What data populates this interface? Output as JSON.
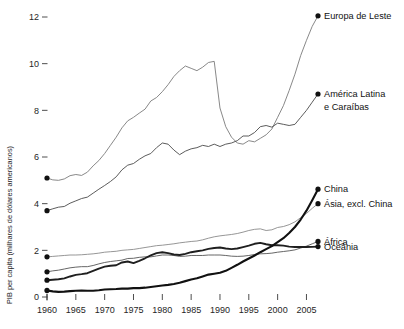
{
  "chart_data": {
    "type": "line",
    "title": "",
    "subtitle": "",
    "xlabel": "",
    "ylabel": "PIB per capita (milhares de dólares americanos)",
    "xlim": [
      1960,
      2007
    ],
    "ylim": [
      0,
      12.6
    ],
    "grid": false,
    "legend_position": "right-inline-labels",
    "x_ticks": [
      "1960",
      "1965",
      "1970",
      "1975",
      "1980",
      "1985",
      "1990",
      "1995",
      "2000",
      "2005"
    ],
    "x_tick_values": [
      1960,
      1965,
      1970,
      1975,
      1980,
      1985,
      1990,
      1995,
      2000,
      2005
    ],
    "y_ticks": [
      "0",
      "2",
      "4",
      "6",
      "8",
      "10",
      "12"
    ],
    "y_tick_values": [
      0,
      2,
      4,
      6,
      8,
      10,
      12
    ],
    "x": [
      1960,
      1961,
      1962,
      1963,
      1964,
      1965,
      1966,
      1967,
      1968,
      1969,
      1970,
      1971,
      1972,
      1973,
      1974,
      1975,
      1976,
      1977,
      1978,
      1979,
      1980,
      1981,
      1982,
      1983,
      1984,
      1985,
      1986,
      1987,
      1988,
      1989,
      1990,
      1991,
      1992,
      1993,
      1994,
      1995,
      1996,
      1997,
      1998,
      1999,
      2000,
      2001,
      2002,
      2003,
      2004,
      2005,
      2006,
      2007
    ],
    "series": [
      {
        "name": "Europa de Leste",
        "color": "#7a7a7a",
        "width": 0.9,
        "label_x": 2008,
        "values": [
          5.1,
          5.02,
          5.0,
          5.06,
          5.2,
          5.25,
          5.21,
          5.35,
          5.62,
          5.85,
          6.15,
          6.5,
          6.85,
          7.25,
          7.55,
          7.7,
          7.88,
          8.05,
          8.4,
          8.55,
          8.8,
          9.1,
          9.45,
          9.7,
          9.9,
          9.8,
          9.7,
          9.85,
          10.05,
          10.1,
          8.1,
          7.3,
          6.85,
          6.6,
          6.55,
          6.7,
          6.65,
          6.8,
          6.95,
          7.2,
          7.7,
          8.2,
          8.85,
          9.55,
          10.35,
          11.0,
          11.6,
          12.05
        ]
      },
      {
        "name": "América Latina e Caraíbas",
        "color": "#4a4a4a",
        "width": 0.9,
        "label_x": 2008,
        "values": [
          3.7,
          3.78,
          3.85,
          3.88,
          4.02,
          4.12,
          4.22,
          4.28,
          4.45,
          4.62,
          4.78,
          4.95,
          5.15,
          5.45,
          5.65,
          5.72,
          5.9,
          6.05,
          6.15,
          6.4,
          6.6,
          6.55,
          6.3,
          6.1,
          6.25,
          6.35,
          6.4,
          6.5,
          6.45,
          6.55,
          6.45,
          6.55,
          6.6,
          6.7,
          6.9,
          6.9,
          7.05,
          7.3,
          7.35,
          7.28,
          7.45,
          7.4,
          7.35,
          7.4,
          7.7,
          8.0,
          8.35,
          8.7
        ]
      },
      {
        "name": "Ásia, excl. China",
        "color": "#8a8a8a",
        "width": 0.9,
        "label_x": 2008,
        "values": [
          1.72,
          1.74,
          1.76,
          1.78,
          1.8,
          1.8,
          1.81,
          1.83,
          1.85,
          1.88,
          1.92,
          1.94,
          1.96,
          2.0,
          2.02,
          2.04,
          2.08,
          2.12,
          2.16,
          2.2,
          2.22,
          2.25,
          2.28,
          2.32,
          2.35,
          2.38,
          2.4,
          2.45,
          2.52,
          2.58,
          2.62,
          2.65,
          2.68,
          2.72,
          2.78,
          2.85,
          2.9,
          2.92,
          2.85,
          2.88,
          2.98,
          3.02,
          3.1,
          3.22,
          3.4,
          3.58,
          3.8,
          4.0
        ]
      },
      {
        "name": "África",
        "color": "#555555",
        "width": 0.9,
        "label_x": 2008,
        "values": [
          1.08,
          1.12,
          1.15,
          1.2,
          1.25,
          1.28,
          1.3,
          1.3,
          1.35,
          1.42,
          1.48,
          1.52,
          1.55,
          1.58,
          1.65,
          1.66,
          1.7,
          1.72,
          1.72,
          1.76,
          1.8,
          1.8,
          1.78,
          1.74,
          1.75,
          1.78,
          1.78,
          1.78,
          1.8,
          1.8,
          1.8,
          1.78,
          1.75,
          1.74,
          1.75,
          1.78,
          1.82,
          1.85,
          1.86,
          1.88,
          1.92,
          1.95,
          1.98,
          2.02,
          2.1,
          2.18,
          2.28,
          2.38
        ]
      },
      {
        "name": "Oceânia",
        "color": "#1f1f1f",
        "width": 1.9,
        "label_x": 2008,
        "values": [
          0.72,
          0.74,
          0.76,
          0.8,
          0.88,
          0.95,
          0.98,
          1.02,
          1.12,
          1.22,
          1.3,
          1.34,
          1.36,
          1.48,
          1.52,
          1.45,
          1.55,
          1.66,
          1.78,
          1.88,
          1.92,
          1.88,
          1.82,
          1.8,
          1.85,
          1.92,
          1.96,
          2.0,
          2.06,
          2.1,
          2.12,
          2.08,
          2.05,
          2.08,
          2.14,
          2.2,
          2.28,
          2.32,
          2.26,
          2.22,
          2.22,
          2.2,
          2.16,
          2.14,
          2.14,
          2.14,
          2.15,
          2.16
        ]
      },
      {
        "name": "China",
        "color": "#111111",
        "width": 2.1,
        "label_x": 2008,
        "values": [
          0.28,
          0.24,
          0.22,
          0.23,
          0.25,
          0.27,
          0.28,
          0.27,
          0.27,
          0.29,
          0.32,
          0.33,
          0.34,
          0.36,
          0.36,
          0.38,
          0.38,
          0.4,
          0.43,
          0.46,
          0.49,
          0.52,
          0.56,
          0.61,
          0.68,
          0.75,
          0.8,
          0.88,
          0.96,
          1.0,
          1.04,
          1.12,
          1.25,
          1.38,
          1.52,
          1.65,
          1.78,
          1.92,
          2.05,
          2.18,
          2.35,
          2.52,
          2.74,
          3.0,
          3.32,
          3.7,
          4.15,
          4.62
        ]
      }
    ],
    "annotations": [
      {
        "text": "Europa de Leste",
        "value": 12.05,
        "year": 2007
      },
      {
        "text": "América Latina",
        "value": 8.7,
        "year": 2007
      },
      {
        "text": "e Caraíbas",
        "value": 8.7,
        "year": 2007
      },
      {
        "text": "China",
        "value": 4.62,
        "year": 2007
      },
      {
        "text": "Ásia, excl. China",
        "value": 4.0,
        "year": 2007
      },
      {
        "text": "África",
        "value": 2.38,
        "year": 2007
      },
      {
        "text": "Oceânia",
        "value": 2.16,
        "year": 2007
      }
    ],
    "series_labels": [
      {
        "name": "Europa de Leste",
        "lines": [
          "Europa de Leste"
        ]
      },
      {
        "name": "América Latina e Caraíbas",
        "lines": [
          "América Latina",
          "e Caraíbas"
        ]
      },
      {
        "name": "China",
        "lines": [
          "China"
        ]
      },
      {
        "name": "Ásia, excl. China",
        "lines": [
          "Ásia, excl. China"
        ]
      },
      {
        "name": "África",
        "lines": [
          "África"
        ]
      },
      {
        "name": "Oceânia",
        "lines": [
          "Oceânia"
        ]
      }
    ]
  }
}
